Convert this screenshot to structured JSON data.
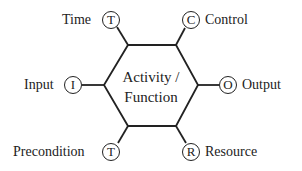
{
  "diagram": {
    "center": {
      "line1": "Activity /",
      "line2": "Function"
    },
    "aspects": [
      {
        "key": "time",
        "label": "Time",
        "letter": "T"
      },
      {
        "key": "control",
        "label": "Control",
        "letter": "C"
      },
      {
        "key": "input",
        "label": "Input",
        "letter": "I"
      },
      {
        "key": "output",
        "label": "Output",
        "letter": "O"
      },
      {
        "key": "precondition",
        "label": "Precondition",
        "letter": "T"
      },
      {
        "key": "resource",
        "label": "Resource",
        "letter": "R"
      }
    ],
    "colors": {
      "stroke": "#222222",
      "background": "#ffffff"
    }
  }
}
